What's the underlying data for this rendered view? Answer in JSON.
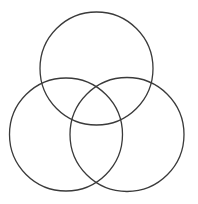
{
  "diagram": {
    "type": "venn-3",
    "background": "#ffffff",
    "stroke_color": "#3a3a3a",
    "stroke_width": 1.3,
    "circles": [
      {
        "name": "top-circle",
        "cx": 96.5,
        "cy": 68.5,
        "r": 56.5
      },
      {
        "name": "bottom-left-circle",
        "cx": 66,
        "cy": 134.5,
        "r": 56.5
      },
      {
        "name": "bottom-right-circle",
        "cx": 127,
        "cy": 134.5,
        "r": 57
      }
    ]
  }
}
